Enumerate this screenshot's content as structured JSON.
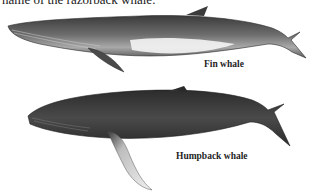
{
  "text": {
    "top_caption": "name of the razorback whale."
  },
  "illustrations": [
    {
      "label": "Fin whale"
    },
    {
      "label": "Humpback whale"
    }
  ]
}
